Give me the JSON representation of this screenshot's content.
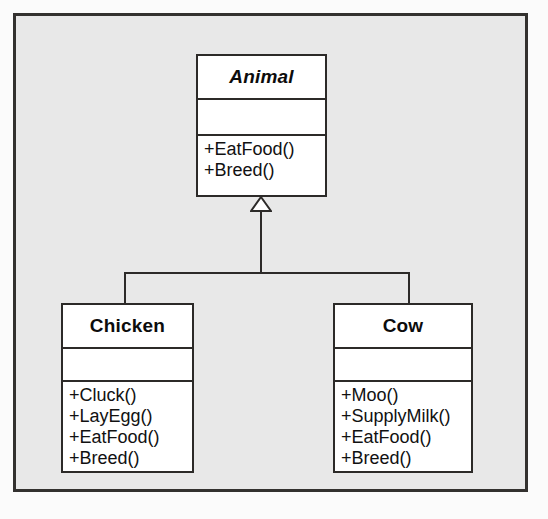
{
  "diagram": {
    "type": "uml-class-diagram",
    "relationship": "generalization",
    "colors": {
      "canvas_background": "#e8e8e8",
      "canvas_border": "#33312f",
      "class_fill": "#ffffff",
      "class_border": "#2c2a28",
      "text": "#0c0c0c",
      "page_background": "#fbfbfb"
    },
    "classes": [
      {
        "id": "animal",
        "name": "Animal",
        "abstract": true,
        "attributes": [],
        "operations": [
          "+EatFood()",
          "+Breed()"
        ]
      },
      {
        "id": "chicken",
        "name": "Chicken",
        "abstract": false,
        "attributes": [],
        "operations": [
          "+Cluck()",
          "+LayEgg()",
          "+EatFood()",
          "+Breed()"
        ]
      },
      {
        "id": "cow",
        "name": "Cow",
        "abstract": false,
        "attributes": [],
        "operations": [
          "+Moo()",
          "+SupplyMilk()",
          "+EatFood()",
          "+Breed()"
        ]
      }
    ],
    "generalizations": [
      {
        "from": "chicken",
        "to": "animal"
      },
      {
        "from": "cow",
        "to": "animal"
      }
    ]
  }
}
